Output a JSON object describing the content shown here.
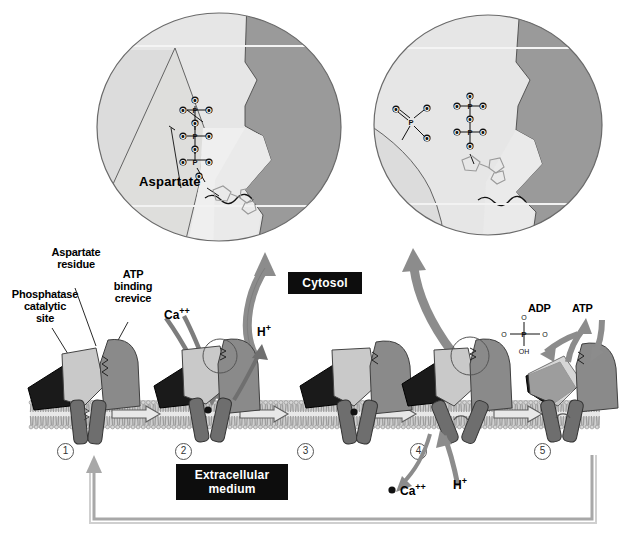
{
  "figure": {
    "type": "biological-mechanism-diagram"
  },
  "colors": {
    "protein_dark_triangle": "#1a1a1a",
    "protein_light_domain": "#c9c9c9",
    "protein_mid_domain": "#8a8a8a",
    "membrane_helix": "#6e6e6e",
    "bilayer": "#b8b8b8",
    "inset_light": "#e0e0e0",
    "inset_mid": "#c2c2c2",
    "inset_dark": "#8f8f8f",
    "arrow_gray": "#8c8c8c",
    "label_box_bg": "#0d0d0d",
    "label_box_text": "#ffffff"
  },
  "insets": {
    "left": {
      "name": "atp-bound-crevice-inset",
      "residue_label": "Aspartate",
      "molecule": "ATP",
      "phosphate_atoms": [
        "O",
        "P",
        "O",
        "O",
        "O",
        "P",
        "O",
        "O",
        "O",
        "P",
        "O",
        "O"
      ],
      "phosphate_count": 3
    },
    "right": {
      "name": "phosphorylated-aspartate-inset",
      "molecule": "ADP",
      "phosphate_count": 2,
      "transferred_phosphate": {
        "center": "P",
        "substituents": [
          "O",
          "O",
          "O"
        ]
      }
    }
  },
  "labels": {
    "phosphatase": "Phosphatase\ncatalytic\nsite",
    "phosphatase_lines": [
      "Phosphatase",
      "catalytic",
      "site"
    ],
    "aspartate_residue_lines": [
      "Aspartate",
      "residue"
    ],
    "atp_crevice_lines": [
      "ATP",
      "binding",
      "crevice"
    ],
    "cytosol": "Cytosol",
    "extracellular_lines": [
      "Extracellular",
      "medium"
    ]
  },
  "ions": {
    "calcium": "Ca",
    "calcium_charge": "++",
    "proton": "H",
    "proton_charge": "+"
  },
  "nucleotides": {
    "adp": "ADP",
    "atp": "ATP"
  },
  "phosphate_diagram": {
    "center": "P",
    "top": "O",
    "left": "O",
    "right": "O",
    "bottom": "OH"
  },
  "steps": [
    {
      "id": "1",
      "label": "1",
      "name": "step-1-resting-state",
      "annotations": []
    },
    {
      "id": "2",
      "label": "2",
      "name": "step-2-calcium-binding",
      "annotations": [
        "Ca++",
        "H+"
      ]
    },
    {
      "id": "3",
      "label": "3",
      "name": "step-3-occluded-state",
      "annotations": []
    },
    {
      "id": "4",
      "label": "4",
      "name": "step-4-calcium-release",
      "annotations": [
        "Ca++",
        "H+"
      ]
    },
    {
      "id": "5",
      "label": "5",
      "name": "step-5-dephosphorylation",
      "annotations": [
        "ADP",
        "ATP",
        "Pi"
      ]
    }
  ]
}
